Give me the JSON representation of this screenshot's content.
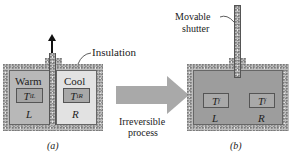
{
  "panel_a": {
    "caption": "(a)",
    "left_label": "Warm",
    "right_label": "Cool",
    "left_temp": {
      "symbol": "T",
      "subscript": "iL"
    },
    "right_temp": {
      "symbol": "T",
      "subscript": "iR"
    },
    "left_side": "L",
    "right_side": "R",
    "insulation_label": "Insulation",
    "colors": {
      "warm": "#b8b8b8",
      "cool": "#e2e2e2",
      "temp_box_warm": "#a4a4a4",
      "temp_box_cool": "#a8a8a8"
    }
  },
  "process_arrow": {
    "line1": "Irreversible",
    "line2": "process",
    "color": "#a9a9a9"
  },
  "panel_b": {
    "caption": "(b)",
    "shutter_label_line1": "Movable",
    "shutter_label_line2": "shutter",
    "left_temp": {
      "symbol": "T",
      "subscript": "f"
    },
    "right_temp": {
      "symbol": "T",
      "subscript": "f"
    },
    "left_side": "L",
    "right_side": "R",
    "colors": {
      "gas": "#9d9d9d",
      "temp_box": "#a9a9a9"
    }
  }
}
